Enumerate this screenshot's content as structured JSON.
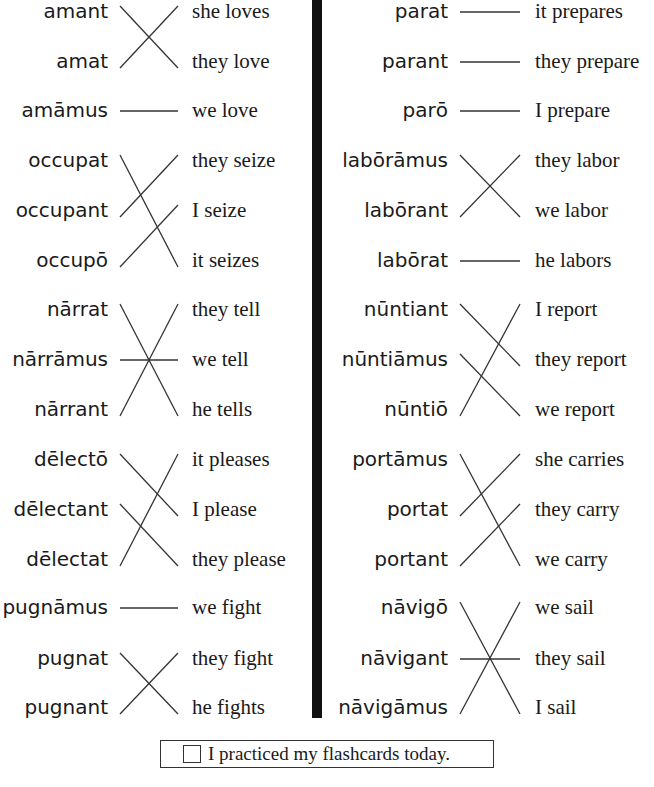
{
  "left_column": {
    "rows": [
      {
        "latin": "amant",
        "english": "she loves"
      },
      {
        "latin": "amat",
        "english": "they love"
      },
      {
        "latin": "amāmus",
        "english": "we love"
      },
      {
        "latin": "occupat",
        "english": "they seize"
      },
      {
        "latin": "occupant",
        "english": "I seize"
      },
      {
        "latin": "occupō",
        "english": "it seizes"
      },
      {
        "latin": "nārrat",
        "english": "they tell"
      },
      {
        "latin": "nārrāmus",
        "english": "we tell"
      },
      {
        "latin": "nārrant",
        "english": "he tells"
      },
      {
        "latin": "dēlectō",
        "english": "it pleases"
      },
      {
        "latin": "dēlectant",
        "english": "I please"
      },
      {
        "latin": "dēlectat",
        "english": "they please"
      },
      {
        "latin": "pugnāmus",
        "english": "we fight"
      },
      {
        "latin": "pugnat",
        "english": "they fight"
      },
      {
        "latin": "pugnant",
        "english": "he fights"
      }
    ],
    "connections": [
      [
        0,
        1
      ],
      [
        1,
        0
      ],
      [
        2,
        2
      ],
      [
        3,
        5
      ],
      [
        4,
        3
      ],
      [
        5,
        4
      ],
      [
        6,
        8
      ],
      [
        7,
        7
      ],
      [
        8,
        6
      ],
      [
        9,
        10
      ],
      [
        10,
        11
      ],
      [
        11,
        9
      ],
      [
        12,
        12
      ],
      [
        13,
        14
      ],
      [
        14,
        13
      ]
    ]
  },
  "right_column": {
    "rows": [
      {
        "latin": "parat",
        "english": "it prepares"
      },
      {
        "latin": "parant",
        "english": "they prepare"
      },
      {
        "latin": "parō",
        "english": "I prepare"
      },
      {
        "latin": "labōrāmus",
        "english": "they labor"
      },
      {
        "latin": "labōrant",
        "english": "we labor"
      },
      {
        "latin": "labōrat",
        "english": "he labors"
      },
      {
        "latin": "nūntiant",
        "english": "I report"
      },
      {
        "latin": "nūntiāmus",
        "english": "they report"
      },
      {
        "latin": "nūntiō",
        "english": "we report"
      },
      {
        "latin": "portāmus",
        "english": "she carries"
      },
      {
        "latin": "portat",
        "english": "they carry"
      },
      {
        "latin": "portant",
        "english": "we carry"
      },
      {
        "latin": "nāvigō",
        "english": "we sail"
      },
      {
        "latin": "nāvigant",
        "english": "they sail"
      },
      {
        "latin": "nāvigāmus",
        "english": "I sail"
      }
    ],
    "connections": [
      [
        0,
        0
      ],
      [
        1,
        1
      ],
      [
        2,
        2
      ],
      [
        3,
        4
      ],
      [
        4,
        3
      ],
      [
        5,
        5
      ],
      [
        6,
        7
      ],
      [
        7,
        8
      ],
      [
        8,
        6
      ],
      [
        9,
        11
      ],
      [
        10,
        9
      ],
      [
        11,
        10
      ],
      [
        12,
        14
      ],
      [
        13,
        13
      ],
      [
        14,
        12
      ]
    ]
  },
  "footer": {
    "checkbox_checked": false,
    "label": "I practiced my flashcards today."
  }
}
